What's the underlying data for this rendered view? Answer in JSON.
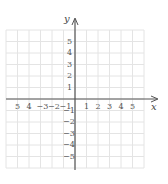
{
  "diagram": {
    "type": "coordinate-plane",
    "grid": {
      "min": -6,
      "max": 6,
      "step": 1,
      "color": "#e4e4e4"
    },
    "axes": {
      "color": "#555555",
      "x_label": "x",
      "y_label": "y",
      "x_ticks": [
        "5",
        "4",
        "−3",
        "−2",
        "−1",
        "1",
        "2",
        "3",
        "4",
        "5"
      ],
      "x_tick_values": [
        -5,
        -4,
        -3,
        -2,
        -1,
        1,
        2,
        3,
        4,
        5
      ],
      "y_ticks": [
        "5",
        "4",
        "3",
        "2",
        "1",
        "−1",
        "−2",
        "−3",
        "−4",
        "−5"
      ],
      "y_tick_values": [
        5,
        4,
        3,
        2,
        1,
        -1,
        -2,
        -3,
        -4,
        -5
      ]
    }
  }
}
